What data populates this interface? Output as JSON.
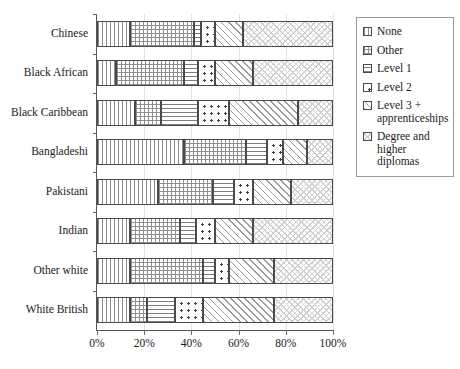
{
  "chart_data": {
    "type": "bar",
    "orientation": "horizontal",
    "stacked": true,
    "normalized": true,
    "title": "",
    "xlabel": "",
    "ylabel": "",
    "xlim": [
      0,
      100
    ],
    "xticks": [
      0,
      20,
      40,
      60,
      80,
      100
    ],
    "xtick_labels": [
      "0%",
      "20%",
      "40%",
      "60%",
      "80%",
      "100%"
    ],
    "grid": true,
    "legend_position": "right",
    "categories": [
      "Chinese",
      "Black African",
      "Black Caribbean",
      "Bangladeshi",
      "Pakistani",
      "Indian",
      "Other white",
      "White British"
    ],
    "series": [
      {
        "name": "None",
        "pattern": "vertical-lines",
        "values": [
          14,
          8,
          16,
          37,
          26,
          14,
          14,
          14
        ]
      },
      {
        "name": "Other",
        "pattern": "cross-hatch",
        "values": [
          27,
          29,
          11,
          26,
          23,
          21,
          31,
          7
        ]
      },
      {
        "name": "Level 1",
        "pattern": "horizontal-lines",
        "values": [
          3,
          6,
          16,
          9,
          9,
          7,
          5,
          12
        ]
      },
      {
        "name": "Level 2",
        "pattern": "dots",
        "values": [
          6,
          7,
          13,
          7,
          8,
          8,
          6,
          12
        ]
      },
      {
        "name": "Level 3 + apprenticeships",
        "pattern": "diagonal-stripes",
        "values": [
          12,
          16,
          29,
          10,
          16,
          16,
          19,
          30
        ]
      },
      {
        "name": "Degree and higher diplomas",
        "pattern": "light-diagonal-cross",
        "values": [
          38,
          34,
          15,
          11,
          18,
          34,
          25,
          25
        ]
      }
    ]
  },
  "legend": {
    "items": [
      {
        "label": "None"
      },
      {
        "label": "Other"
      },
      {
        "label": "Level 1"
      },
      {
        "label": "Level 2"
      },
      {
        "label": "Level 3 + apprenticeships"
      },
      {
        "label": "Degree and higher diplomas"
      }
    ]
  }
}
